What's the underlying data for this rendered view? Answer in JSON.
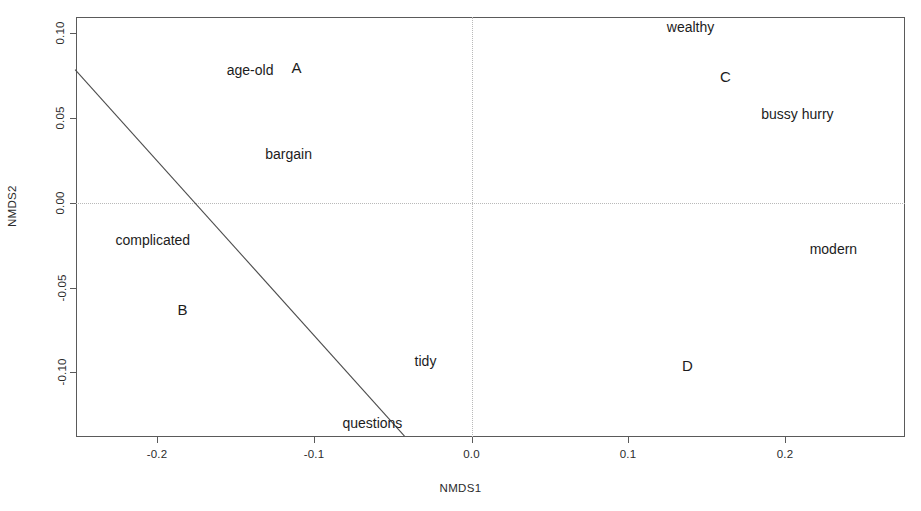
{
  "chart_data": {
    "type": "scatter",
    "title": "",
    "xlabel": "NMDS1",
    "ylabel": "NMDS2",
    "xlim": [
      -0.2525,
      0.2755
    ],
    "ylim": [
      -0.1375,
      0.1095
    ],
    "xticks": [
      -0.2,
      -0.1,
      0.0,
      0.1,
      0.2
    ],
    "xticklabels": [
      "-0.2",
      "-0.1",
      "0.0",
      "0.1",
      "0.2"
    ],
    "yticks": [
      0.1,
      0.05,
      0.0,
      -0.05,
      -0.1
    ],
    "yticklabels": [
      "0.10",
      "0.05",
      "0.00",
      "-0.05",
      "-0.10"
    ],
    "grid": "origin-crosshair-dotted",
    "legend": "none",
    "points": [
      {
        "label": "age-old",
        "x": -0.141,
        "y": 0.0785,
        "kind": "term"
      },
      {
        "label": "A",
        "x": -0.1115,
        "y": 0.08,
        "kind": "cluster"
      },
      {
        "label": "bargain",
        "x": -0.1165,
        "y": 0.029,
        "kind": "term"
      },
      {
        "label": "complicated",
        "x": -0.203,
        "y": -0.0218,
        "kind": "term"
      },
      {
        "label": "B",
        "x": -0.184,
        "y": -0.0624,
        "kind": "cluster"
      },
      {
        "label": "tidy",
        "x": -0.0293,
        "y": -0.0929,
        "kind": "term"
      },
      {
        "label": "questions",
        "x": -0.0631,
        "y": -0.13,
        "kind": "term"
      },
      {
        "label": "wealthy",
        "x": 0.1395,
        "y": 0.1041,
        "kind": "term"
      },
      {
        "label": "C",
        "x": 0.1618,
        "y": 0.0747,
        "kind": "cluster"
      },
      {
        "label": "bussy hurry",
        "x": 0.2076,
        "y": 0.0524,
        "kind": "term"
      },
      {
        "label": "modern",
        "x": 0.2305,
        "y": -0.0271,
        "kind": "term"
      },
      {
        "label": "D",
        "x": 0.1376,
        "y": -0.0953,
        "kind": "cluster"
      }
    ],
    "lines": [
      {
        "name": "fitted-boundary-line",
        "x1": -0.2525,
        "y1": 0.0787,
        "x2": -0.0427,
        "y2": -0.1375
      }
    ],
    "colors": {
      "axis": "#5a5a5a",
      "grid": "#b9b9b9",
      "text": "#1c1c1c",
      "line": "#4d4d4d",
      "background": "#ffffff"
    }
  }
}
